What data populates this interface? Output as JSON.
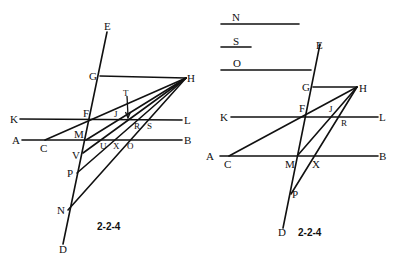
{
  "figures": [
    {
      "id": "left",
      "caption": "2-2-4",
      "labels": {
        "E": "E",
        "G": "G",
        "H": "H",
        "T": "T",
        "K": "K",
        "F": "F",
        "J": "J",
        "L": "L",
        "R": "R",
        "S": "S",
        "A": "A",
        "C": "C",
        "M": "M",
        "B": "B",
        "U": "U",
        "X": "X",
        "O": "O",
        "V": "V",
        "P": "P",
        "N": "N",
        "D": "D"
      },
      "points": {
        "E": [
          107,
          32
        ],
        "D": [
          63,
          244
        ],
        "G": [
          100,
          76
        ],
        "H": [
          186,
          78
        ],
        "K": [
          16,
          119
        ],
        "L": [
          182,
          120
        ],
        "F": [
          90,
          119
        ],
        "A": [
          18,
          140
        ],
        "B": [
          182,
          140
        ],
        "C": [
          45,
          140
        ],
        "M": [
          86,
          140
        ],
        "V": [
          83,
          153
        ],
        "P": [
          77,
          173
        ],
        "N": [
          68,
          210
        ],
        "T": [
          127,
          94
        ],
        "Tarrow": [
          128,
          117
        ],
        "J": [
          117,
          114
        ],
        "R": [
          137,
          120
        ],
        "S": [
          151,
          120
        ],
        "U": [
          103,
          140
        ],
        "X": [
          117,
          140
        ],
        "O": [
          131,
          140
        ]
      }
    },
    {
      "id": "right",
      "caption": "2-2-4",
      "legend": [
        {
          "label": "N",
          "length_px": 79
        },
        {
          "label": "S",
          "length_px": 31
        },
        {
          "label": "O",
          "length_px": 90
        }
      ],
      "labels": {
        "E": "E",
        "G": "G",
        "H": "H",
        "K": "K",
        "F": "F",
        "J": "J",
        "L": "L",
        "R": "R",
        "A": "A",
        "C": "C",
        "M": "M",
        "X": "X",
        "B": "B",
        "P": "P",
        "D": "D"
      },
      "points": {
        "E": [
          320,
          44
        ],
        "D": [
          283,
          228
        ],
        "G": [
          313,
          87
        ],
        "H": [
          357,
          87
        ],
        "K": [
          230,
          117
        ],
        "L": [
          378,
          117
        ],
        "F": [
          306,
          116
        ],
        "A": [
          216,
          156
        ],
        "B": [
          378,
          156
        ],
        "C": [
          229,
          156
        ],
        "M": [
          298,
          155
        ],
        "P": [
          291,
          194
        ],
        "J": [
          330,
          114
        ],
        "R": [
          341,
          117
        ],
        "X": [
          315,
          156
        ]
      }
    }
  ]
}
